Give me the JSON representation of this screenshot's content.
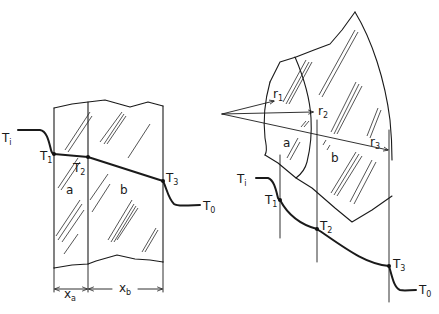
{
  "figure": {
    "left_panel": {
      "description": "Composite plane wall of two layers with temperature profile",
      "layers": [
        {
          "label": "a",
          "thickness_label": "x",
          "thickness_sub": "a"
        },
        {
          "label": "b",
          "thickness_label": "x",
          "thickness_sub": "b"
        }
      ],
      "temperatures": {
        "inner_fluid": {
          "main": "T",
          "sub": "i"
        },
        "t1": {
          "main": "T",
          "sub": "1"
        },
        "t2": {
          "main": "T",
          "sub": "2"
        },
        "t3": {
          "main": "T",
          "sub": "3"
        },
        "outer_fluid": {
          "main": "T",
          "sub": "0"
        }
      }
    },
    "right_panel": {
      "description": "Composite cylindrical wall of two layers with radii and temperature profile",
      "layers": [
        {
          "label": "a"
        },
        {
          "label": "b"
        }
      ],
      "radii": [
        {
          "main": "r",
          "sub": "1"
        },
        {
          "main": "r",
          "sub": "2"
        },
        {
          "main": "r",
          "sub": "3"
        }
      ],
      "temperatures": {
        "inner_fluid": {
          "main": "T",
          "sub": "i"
        },
        "t1": {
          "main": "T",
          "sub": "1"
        },
        "t2": {
          "main": "T",
          "sub": "2"
        },
        "t3": {
          "main": "T",
          "sub": "3"
        },
        "outer_fluid": {
          "main": "T",
          "sub": "0"
        }
      }
    }
  }
}
